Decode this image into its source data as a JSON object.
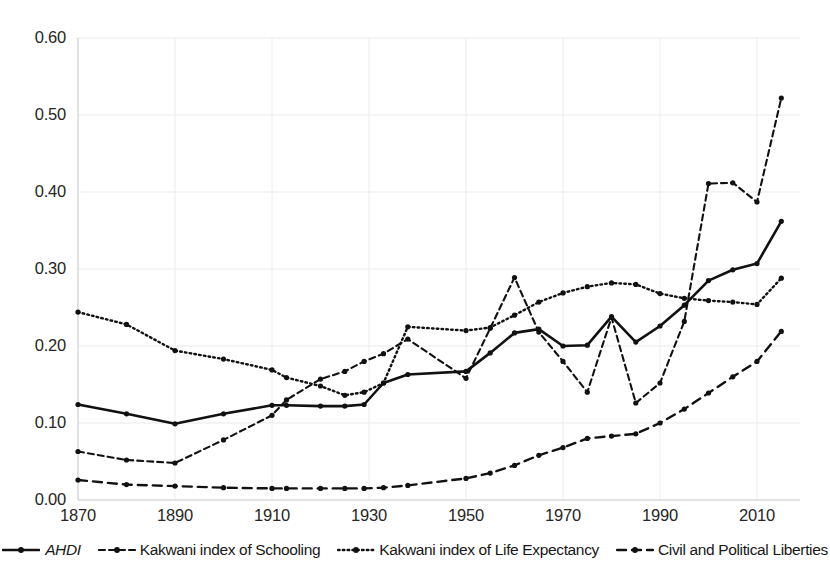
{
  "chart_data": {
    "type": "line",
    "title": "",
    "xlabel": "",
    "ylabel": "",
    "xlim": [
      1870,
      2015
    ],
    "ylim": [
      0.0,
      0.6
    ],
    "grid": true,
    "legend_position": "bottom",
    "x_ticks": [
      "1870",
      "1890",
      "1910",
      "1930",
      "1950",
      "1970",
      "1990",
      "2010"
    ],
    "x_tick_values": [
      1870,
      1890,
      1910,
      1930,
      1950,
      1970,
      1990,
      2010
    ],
    "y_ticks": [
      "0.00",
      "0.10",
      "0.20",
      "0.30",
      "0.40",
      "0.50",
      "0.60"
    ],
    "y_tick_values": [
      0.0,
      0.1,
      0.2,
      0.3,
      0.4,
      0.5,
      0.6
    ],
    "x": [
      1870,
      1880,
      1890,
      1900,
      1910,
      1913,
      1920,
      1925,
      1929,
      1933,
      1938,
      1950,
      1955,
      1960,
      1965,
      1970,
      1975,
      1980,
      1985,
      1990,
      1995,
      2000,
      2005,
      2010,
      2015
    ],
    "series": [
      {
        "name": "AHDI",
        "style": "solid",
        "color": "#111111",
        "values": [
          0.124,
          0.112,
          0.099,
          0.112,
          0.123,
          0.123,
          0.122,
          0.122,
          0.124,
          0.152,
          0.163,
          0.167,
          0.191,
          0.217,
          0.222,
          0.2,
          0.201,
          0.238,
          0.205,
          0.226,
          0.253,
          0.285,
          0.299,
          0.307,
          0.362
        ]
      },
      {
        "name": "Kakwani index of Schooling",
        "style": "dashed",
        "color": "#111111",
        "values": [
          0.063,
          0.052,
          0.048,
          0.078,
          0.11,
          0.13,
          0.157,
          0.167,
          0.18,
          0.19,
          0.209,
          0.158,
          0.223,
          0.289,
          0.218,
          0.18,
          0.14,
          0.237,
          0.126,
          0.152,
          0.232,
          0.411,
          0.412,
          0.387,
          0.522
        ]
      },
      {
        "name": "Kakwani index of Life Expectancy",
        "style": "dotted",
        "color": "#111111",
        "values": [
          0.244,
          0.228,
          0.194,
          0.183,
          0.169,
          0.159,
          0.148,
          0.136,
          0.14,
          0.152,
          0.225,
          0.22,
          0.224,
          0.24,
          0.257,
          0.269,
          0.277,
          0.282,
          0.28,
          0.268,
          0.262,
          0.259,
          0.257,
          0.254,
          0.288
        ]
      },
      {
        "name": "Civil and Political Liberties",
        "style": "longdash",
        "color": "#111111",
        "values": [
          0.026,
          0.02,
          0.018,
          0.016,
          0.015,
          0.015,
          0.015,
          0.015,
          0.015,
          0.016,
          0.019,
          0.028,
          0.035,
          0.045,
          0.058,
          0.068,
          0.08,
          0.083,
          0.086,
          0.1,
          0.118,
          0.139,
          0.16,
          0.18,
          0.219
        ]
      }
    ],
    "legend": [
      {
        "label": "AHDI",
        "style": "solid",
        "italic": true
      },
      {
        "label": "Kakwani index of Schooling",
        "style": "dashed",
        "italic": false
      },
      {
        "label": "Kakwani index of Life Expectancy",
        "style": "dotted",
        "italic": false
      },
      {
        "label": "Civil and Political Liberties",
        "style": "longdash",
        "italic": false
      }
    ]
  }
}
